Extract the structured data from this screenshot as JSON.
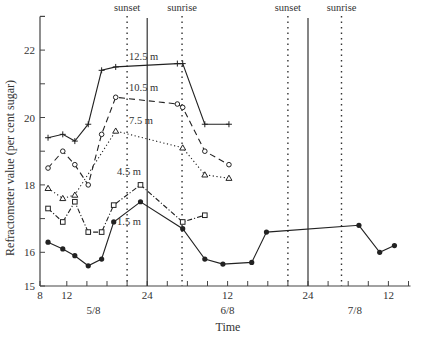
{
  "chart_data": {
    "type": "line",
    "title": "",
    "xlabel": "Time",
    "ylabel": "Refractometer value (per cent sugar)",
    "ylim": [
      15,
      23
    ],
    "yticks": [
      15,
      16,
      17,
      18,
      19,
      20,
      21,
      22
    ],
    "ytick_labels": [
      "15",
      "16",
      "",
      "18",
      "",
      "20",
      "",
      "22"
    ],
    "x_hours_range": [
      8,
      63
    ],
    "xtick_hours": [
      8,
      12,
      15,
      18,
      21,
      24,
      27,
      30,
      33,
      36,
      39,
      42,
      45,
      48,
      51,
      54,
      57,
      60,
      63
    ],
    "xtick_labels": [
      {
        "hour": 8,
        "label": "8"
      },
      {
        "hour": 12,
        "label": "12"
      },
      {
        "hour": 24,
        "label": "24"
      },
      {
        "hour": 36,
        "label": "12"
      },
      {
        "hour": 48,
        "label": "24"
      },
      {
        "hour": 60,
        "label": "12"
      }
    ],
    "date_labels": [
      {
        "hour": 16,
        "label": "5/8"
      },
      {
        "hour": 36,
        "label": "6/8"
      },
      {
        "hour": 55,
        "label": "7/8"
      }
    ],
    "vertical_markers": [
      {
        "hour": 21,
        "style": "dotted",
        "label": "sunset"
      },
      {
        "hour": 24,
        "style": "solid",
        "label": ""
      },
      {
        "hour": 29.2,
        "style": "dotted",
        "label": "sunrise"
      },
      {
        "hour": 45,
        "style": "dotted",
        "label": "sunset"
      },
      {
        "hour": 48,
        "style": "solid",
        "label": ""
      },
      {
        "hour": 53,
        "style": "dotted",
        "label": "sunrise"
      }
    ],
    "series": [
      {
        "name": "12.5 m",
        "marker": "plus",
        "dash": "solid",
        "x": [
          9.2,
          11.4,
          13.2,
          15.2,
          17.2,
          19.3,
          28.5,
          29.3,
          32.6,
          36.2
        ],
        "values": [
          19.4,
          19.5,
          19.3,
          19.8,
          21.4,
          21.5,
          21.6,
          21.6,
          19.8,
          19.8
        ],
        "label_pos": {
          "hour": 21.3,
          "value": 21.7
        }
      },
      {
        "name": "10.5 m",
        "marker": "circle",
        "dash": "dashed",
        "x": [
          9.2,
          11.4,
          13.2,
          15.2,
          17.2,
          19.3,
          28.5,
          29.3,
          32.6,
          36.2
        ],
        "values": [
          18.5,
          19.0,
          18.6,
          18.0,
          19.5,
          20.6,
          20.4,
          20.3,
          19.0,
          18.6
        ],
        "label_pos": {
          "hour": 21.3,
          "value": 20.8
        }
      },
      {
        "name": "7.5 m",
        "marker": "triangle",
        "dash": "dotted",
        "x": [
          9.2,
          11.4,
          13.2,
          19.3,
          29.3,
          32.6,
          36.2
        ],
        "values": [
          17.9,
          17.6,
          17.7,
          19.6,
          19.1,
          18.3,
          18.2
        ],
        "label_pos": {
          "hour": 21.3,
          "value": 19.8
        }
      },
      {
        "name": "4.5 m",
        "marker": "square",
        "dash": "dashdot",
        "x": [
          9.2,
          11.4,
          13.2,
          15.2,
          17.2,
          19.0,
          23.0,
          29.3,
          32.6
        ],
        "values": [
          17.3,
          16.9,
          17.5,
          16.6,
          16.6,
          17.4,
          18.0,
          16.9,
          17.1
        ],
        "label_pos": {
          "hour": 19.5,
          "value": 18.3
        }
      },
      {
        "name": "1.5 m",
        "marker": "filled-circle",
        "dash": "solid",
        "x": [
          9.2,
          11.4,
          13.2,
          15.2,
          17.2,
          19.0,
          23.0,
          29.3,
          32.6,
          35.3,
          39.6,
          41.8,
          55.6,
          58.7,
          60.9
        ],
        "values": [
          16.3,
          16.1,
          15.9,
          15.6,
          15.8,
          16.9,
          17.5,
          16.7,
          15.8,
          15.65,
          15.7,
          16.6,
          16.8,
          16.0,
          16.2
        ],
        "label_pos": {
          "hour": 19.5,
          "value": 16.8
        }
      }
    ],
    "grid": false,
    "legend": "inline labels"
  },
  "labels": {
    "ylabel": "Refractometer value (per cent sugar)",
    "xlabel": "Time",
    "sunset": "sunset",
    "sunrise": "sunrise"
  }
}
